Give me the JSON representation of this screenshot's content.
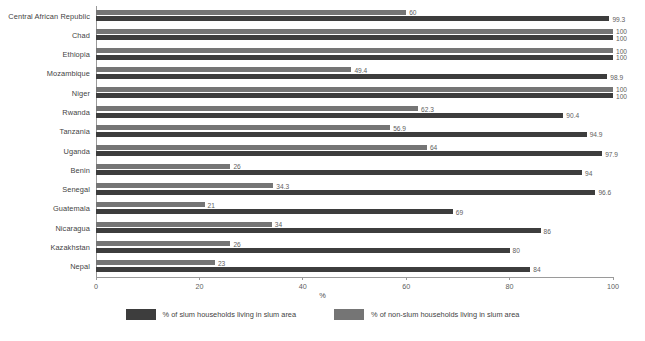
{
  "chart_data": {
    "type": "bar",
    "orientation": "horizontal",
    "title": "",
    "subtitle": "",
    "xlabel": "%",
    "ylabel": "",
    "xlim": [
      0,
      100
    ],
    "xticks": [
      0,
      20,
      40,
      60,
      80,
      100
    ],
    "grid": false,
    "legend_position": "bottom",
    "categories": [
      "Central African Republic",
      "Chad",
      "Ethiopia",
      "Mozambique",
      "Niger",
      "Rwanda",
      "Tanzania",
      "Uganda",
      "Benin",
      "Senegal",
      "Guatemala",
      "Nicaragua",
      "Kazakhstan",
      "Nepal"
    ],
    "series": [
      {
        "name": "% of non-slum households living in slum area",
        "color": "#757575",
        "values": [
          60,
          100,
          100,
          49.4,
          100,
          62.3,
          56.9,
          64,
          26,
          34.3,
          21,
          34,
          26,
          23
        ],
        "labels": [
          "60",
          "100",
          "100",
          "49.4",
          "100",
          "62.3",
          "56.9",
          "64",
          "26",
          "34.3",
          "21",
          "34",
          "26",
          "23"
        ]
      },
      {
        "name": "% of slum households living in slum area",
        "color": "#3d3d3d",
        "values": [
          99.3,
          100,
          100,
          98.9,
          100,
          90.4,
          94.9,
          97.9,
          94,
          96.6,
          69,
          86,
          80,
          84
        ],
        "labels": [
          "99.3",
          "100",
          "100",
          "98.9",
          "100",
          "90.4",
          "94.9",
          "97.9",
          "94",
          "96.6",
          "69",
          "86",
          "80",
          "84"
        ]
      }
    ]
  },
  "legend": {
    "items": [
      {
        "label": "% of slum households living in slum area",
        "color": "#3d3d3d",
        "swatch": "dark"
      },
      {
        "label": "% of non-slum households living in slum area",
        "color": "#757575",
        "swatch": "light"
      }
    ]
  },
  "axis": {
    "x_title": "%",
    "tick_labels": [
      "0",
      "20",
      "40",
      "60",
      "80",
      "100"
    ]
  }
}
